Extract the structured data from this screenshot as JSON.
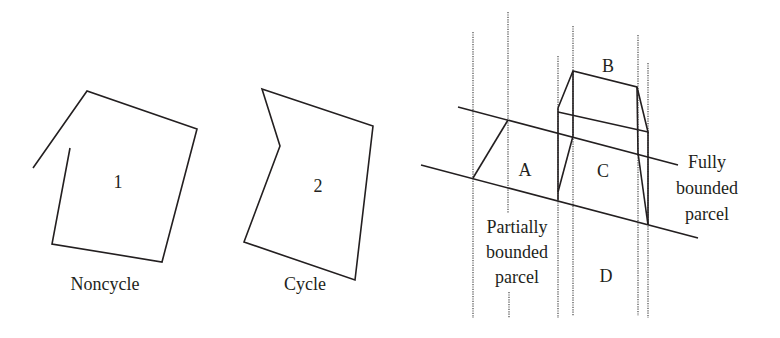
{
  "figures": [
    {
      "id": "noncycle",
      "region_label": "1",
      "caption": "Noncycle"
    },
    {
      "id": "cycle",
      "region_label": "2",
      "caption": "Cycle"
    },
    {
      "id": "parcels",
      "parcel_labels": [
        "A",
        "B",
        "C",
        "D"
      ],
      "annotations": {
        "fully_bounded": [
          "Fully",
          "bounded",
          "parcel"
        ],
        "partially_bounded": [
          "Partially",
          "bounded",
          "parcel"
        ]
      }
    }
  ],
  "colors": {
    "line": "#231f20",
    "dotted": "#555555",
    "background": "#ffffff"
  }
}
